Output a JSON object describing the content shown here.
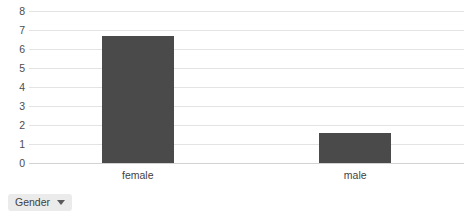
{
  "chart_data": {
    "type": "bar",
    "title": "",
    "subtitle": "",
    "xlabel": "",
    "ylabel": "",
    "categories": [
      "female",
      "male"
    ],
    "values": [
      6.7,
      1.6
    ],
    "series": [
      {
        "name": "Count",
        "values": [
          6.7,
          1.6
        ]
      }
    ],
    "ylim": [
      0,
      8
    ],
    "ytick_labels": [
      "8",
      "7",
      "6",
      "5",
      "4",
      "3",
      "2",
      "1",
      "0"
    ],
    "ytick_values": [
      8,
      7,
      6,
      5,
      4,
      3,
      2,
      1,
      0
    ],
    "grid": true,
    "legend_position": "none",
    "bar_color": "#4a4a4a",
    "gridline_color": "#e3e3e3",
    "axis_color": "#d2d2d2"
  },
  "filter": {
    "label": "Gender",
    "caret_icon": "chevron-down-icon"
  }
}
